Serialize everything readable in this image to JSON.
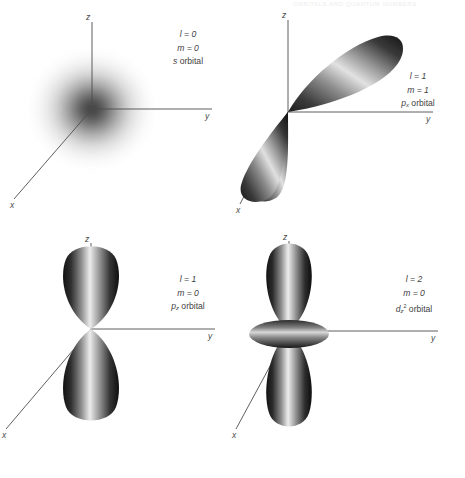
{
  "figure": {
    "running_head": "ORBITALS AND QUANTUM NUMBERS",
    "background": "#ffffff",
    "ink": "#2b2b2b"
  },
  "axes": {
    "x_label": "x",
    "y_label": "y",
    "z_label": "z",
    "description": "z vertical up, y horizontal right, x diagonal toward lower-left"
  },
  "panels": [
    {
      "id": "s",
      "orbital_type": "s",
      "l_label": "l = 0",
      "m_label": "m = 0",
      "name_prefix": "s",
      "name_sub": "",
      "name_sup": "",
      "name_suffix": " orbital",
      "shape": "spherical diffuse cloud"
    },
    {
      "id": "px",
      "orbital_type": "p",
      "l_label": "l = 1",
      "m_label": "m = 1",
      "name_prefix": "p",
      "name_sub": "x",
      "name_sup": "",
      "name_suffix": " orbital",
      "shape": "two lobes tilted along the x axis"
    },
    {
      "id": "pz",
      "orbital_type": "p",
      "l_label": "l = 1",
      "m_label": "m = 0",
      "name_prefix": "p",
      "name_sub": "z",
      "name_sup": "",
      "name_suffix": " orbital",
      "shape": "two lobes along the vertical z axis"
    },
    {
      "id": "dz2",
      "orbital_type": "d",
      "l_label": "l = 2",
      "m_label": "m = 0",
      "name_prefix": "d",
      "name_sub": "z",
      "name_sup": "2",
      "name_suffix": " orbital",
      "shape": "two lobes along z with an equatorial torus"
    }
  ]
}
